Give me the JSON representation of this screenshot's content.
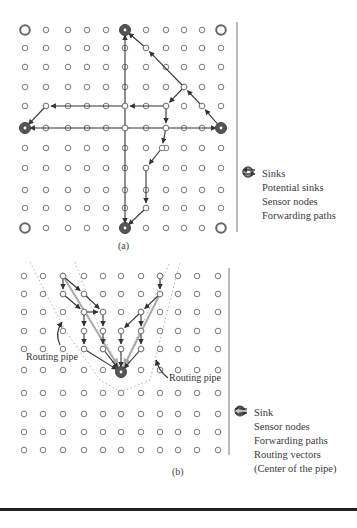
{
  "figure_a": {
    "caption": "(a)",
    "grid": {
      "cols_x": [
        25,
        46,
        68,
        87,
        106,
        125,
        146,
        166,
        184,
        202,
        221
      ],
      "rows_y": [
        30,
        48,
        67,
        87,
        106,
        128,
        148,
        168,
        190,
        208,
        228
      ]
    },
    "sinks": [
      [
        125,
        30
      ],
      [
        25,
        128
      ],
      [
        221,
        128
      ],
      [
        125,
        228
      ]
    ],
    "potential_sinks": [
      [
        25,
        30
      ],
      [
        221,
        30
      ],
      [
        25,
        228
      ],
      [
        221,
        228
      ]
    ],
    "paths": [
      [
        [
          125,
          128
        ],
        [
          125,
          30
        ]
      ],
      [
        [
          125,
          128
        ],
        [
          125,
          228
        ]
      ],
      [
        [
          125,
          128
        ],
        [
          25,
          128
        ]
      ],
      [
        [
          125,
          128
        ],
        [
          221,
          128
        ]
      ],
      [
        [
          125,
          106
        ],
        [
          46,
          106
        ],
        [
          25,
          128
        ]
      ],
      [
        [
          166,
          106
        ],
        [
          125,
          106
        ]
      ],
      [
        [
          184,
          87
        ],
        [
          166,
          106
        ],
        [
          166,
          128
        ],
        [
          162,
          148
        ],
        [
          146,
          168
        ],
        [
          146,
          208
        ],
        [
          125,
          228
        ]
      ],
      [
        [
          221,
          128
        ],
        [
          202,
          106
        ],
        [
          184,
          87
        ],
        [
          146,
          48
        ],
        [
          125,
          30
        ]
      ]
    ],
    "legend": {
      "items": [
        {
          "icon": "sink-icon",
          "label": "Sinks"
        },
        {
          "icon": "potential-sink-icon",
          "label": "Potential sinks"
        },
        {
          "icon": "sensor-node-icon",
          "label": "Sensor nodes"
        },
        {
          "icon": "forwarding-paths-icon",
          "label": "Forwarding paths"
        }
      ]
    }
  },
  "figure_b": {
    "caption": "(b)",
    "grid": {
      "cols_x": [
        24,
        43,
        63,
        84,
        103,
        121,
        141,
        160,
        178,
        197,
        218
      ],
      "rows_y": [
        276,
        294,
        312,
        331,
        349,
        370,
        393,
        414,
        432,
        450
      ]
    },
    "sink": [
      121,
      372
    ],
    "paths": [
      [
        [
          63,
          276
        ],
        [
          63,
          294
        ],
        [
          84,
          312
        ],
        [
          84,
          331
        ],
        [
          84,
          349
        ],
        [
          121,
          372
        ]
      ],
      [
        [
          63,
          276
        ],
        [
          84,
          294
        ],
        [
          103,
          312
        ],
        [
          103,
          331
        ],
        [
          103,
          349
        ],
        [
          121,
          372
        ]
      ],
      [
        [
          84,
          312
        ],
        [
          103,
          312
        ]
      ],
      [
        [
          160,
          276
        ],
        [
          160,
          294
        ],
        [
          141,
          312
        ],
        [
          121,
          331
        ],
        [
          121,
          349
        ],
        [
          121,
          372
        ]
      ],
      [
        [
          141,
          312
        ],
        [
          141,
          331
        ],
        [
          141,
          349
        ],
        [
          121,
          372
        ]
      ]
    ],
    "routing_vectors": [
      [
        [
          63,
          276
        ],
        [
          118,
          366
        ]
      ],
      [
        [
          160,
          294
        ],
        [
          124,
          366
        ]
      ]
    ],
    "pipes": [
      [
        [
          30,
          262
        ],
        [
          65,
          330
        ],
        [
          100,
          380
        ],
        [
          121,
          392
        ],
        [
          150,
          380
        ],
        [
          180,
          262
        ]
      ],
      [
        [
          75,
          262
        ],
        [
          100,
          330
        ],
        [
          121,
          372
        ],
        [
          140,
          330
        ],
        [
          170,
          262
        ]
      ]
    ],
    "labels": [
      {
        "text": "Routing pipe",
        "x": 26,
        "y": 358
      },
      {
        "text": "Routing pipe",
        "x": 169,
        "y": 378
      }
    ],
    "legend": {
      "items": [
        {
          "icon": "sink-icon",
          "label": "Sink"
        },
        {
          "icon": "sensor-node-icon",
          "label": "Sensor nodes"
        },
        {
          "icon": "forwarding-paths-icon",
          "label": "Forwarding paths"
        },
        {
          "icon": "routing-vectors-icon",
          "label": "Routing vectors"
        },
        {
          "icon": "pipe-center-icon",
          "label": "(Center of the pipe)"
        }
      ]
    }
  },
  "colors": {
    "node_stroke": "#7a7a7a",
    "sink_fill": "#555555",
    "path": "#333333",
    "routing_vector": "#a8a8a8",
    "pipe": "#b5b5b5"
  }
}
